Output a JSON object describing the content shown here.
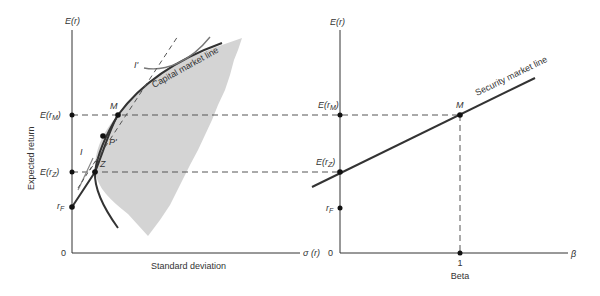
{
  "left_chart": {
    "y_axis_label_top": "E(r)",
    "y_axis_title": "Expected return",
    "x_axis_title": "Standard deviation",
    "x_axis_symbol": "σ (r)",
    "origin_label": "0",
    "y_ticks": {
      "E_rM": {
        "base": "E(r",
        "sub": "M",
        "end": ")"
      },
      "E_rZ": {
        "base": "E(r",
        "sub": "Z",
        "end": ")"
      },
      "rF": {
        "base": "r",
        "sub": "F"
      }
    },
    "points": {
      "M": "M",
      "P": "P'",
      "Z": "Z"
    },
    "curve_labels": {
      "I": "I",
      "I_prime": "I'",
      "cml": "Capital market line"
    }
  },
  "right_chart": {
    "y_axis_label_top": "E(r)",
    "x_axis_title": "Beta",
    "x_axis_symbol": "β",
    "origin_label": "0",
    "beta_tick": "1",
    "y_ticks": {
      "E_rM": {
        "base": "E(r",
        "sub": "M",
        "end": ")"
      },
      "E_rZ": {
        "base": "E(r",
        "sub": "Z",
        "end": ")"
      },
      "rF": {
        "base": "r",
        "sub": "F"
      }
    },
    "points": {
      "M": "M"
    },
    "line_label": "Security market line"
  },
  "colors": {
    "ink": "#333333",
    "shade": "#d4d4d4",
    "dash": "#555555"
  }
}
